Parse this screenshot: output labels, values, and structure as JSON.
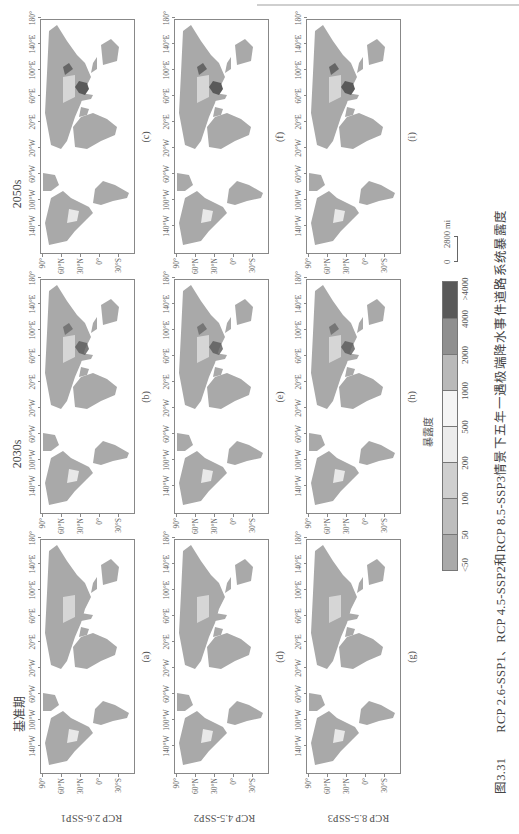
{
  "figure": {
    "caption_number": "图3.31",
    "caption_text": "RCP 2.6-SSP1、RCP 4.5-SSP2和RCP 8.5-SSP3情景下五年一遇极端降水事件道路系统暴露度",
    "column_titles": [
      "基准期",
      "2030s",
      "2050s"
    ],
    "row_labels": [
      "RCP 2.6-SSP1",
      "RCP 4.5-SSP2",
      "RCP 8.5-SSP3"
    ],
    "panels": [
      {
        "letter": "(a)",
        "row": 0,
        "col": 0
      },
      {
        "letter": "(b)",
        "row": 0,
        "col": 1
      },
      {
        "letter": "(c)",
        "row": 0,
        "col": 2
      },
      {
        "letter": "(d)",
        "row": 1,
        "col": 0
      },
      {
        "letter": "(e)",
        "row": 1,
        "col": 1
      },
      {
        "letter": "(f)",
        "row": 1,
        "col": 2
      },
      {
        "letter": "(g)",
        "row": 2,
        "col": 0
      },
      {
        "letter": "(h)",
        "row": 2,
        "col": 1
      },
      {
        "letter": "(i)",
        "row": 2,
        "col": 2
      }
    ],
    "x_ticks": [
      "140°W",
      "100°W",
      "60°W",
      "20°W",
      "20°E",
      "60°E",
      "100°E",
      "140°E",
      "180°"
    ],
    "y_ticks": [
      "90°",
      "60°N",
      "30°N",
      "0°",
      "30°S"
    ]
  },
  "legend": {
    "title": "暴露度",
    "labels": [
      "<50",
      "50",
      "100",
      "200",
      "500",
      "1000",
      "2000",
      "4000",
      ">4000"
    ],
    "colors": [
      "#a9a9a9",
      "#bdbdbd",
      "#cfcfcf",
      "#ececec",
      "#f5f5f5",
      "#b9b9b9",
      "#8f8f8f",
      "#595959"
    ]
  },
  "scalebar": {
    "zero": "0",
    "value": "2800 mi"
  },
  "colors": {
    "land": "#a9a9a9",
    "hotspot": "#5a5a5a",
    "frame": "#888888"
  }
}
